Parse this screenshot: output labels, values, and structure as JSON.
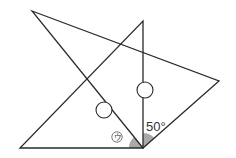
{
  "diagram": {
    "type": "geometry-figure",
    "colors": {
      "line": "#2a2a2a",
      "angle_fill": "#a9a9a9",
      "background": "#ffffff"
    },
    "triangles": [
      {
        "name": "right-triangle",
        "points": [
          [
            20,
            148
          ],
          [
            143,
            148
          ],
          [
            143,
            21
          ]
        ]
      },
      {
        "name": "slanted-triangle",
        "points": [
          [
            32,
            11
          ],
          [
            219,
            81
          ],
          [
            143,
            148
          ]
        ]
      }
    ],
    "shared_vertex": [
      143,
      148
    ],
    "angles": [
      {
        "name": "angle-u",
        "label": "ウ",
        "label_display": "ウ",
        "between": [
          "base-left",
          "to-top-left-vertex"
        ],
        "shaded": true
      },
      {
        "name": "angle-50",
        "label": "50°",
        "between": [
          "vertical-side",
          "to-right-vertex"
        ],
        "shaded": true
      }
    ],
    "blank_circles": [
      {
        "name": "blank-circle-left",
        "center": [
          104,
          110
        ],
        "r": 8
      },
      {
        "name": "blank-circle-right",
        "center": [
          145,
          90
        ],
        "r": 8
      }
    ]
  },
  "labels": {
    "angle_u": "ウ",
    "angle_50": "50°"
  }
}
